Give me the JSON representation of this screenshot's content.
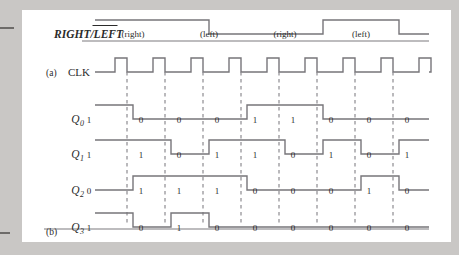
{
  "figure": {
    "part_labels": [
      {
        "name": "a",
        "text": "(a)"
      },
      {
        "name": "b",
        "text": "(b)"
      }
    ]
  },
  "control_signal": {
    "label_left": "RIGHT",
    "label_sep": "/",
    "label_right": "LEFT",
    "label_right_overbar": true,
    "full_label": "RIGHT/LEFT",
    "segments": [
      {
        "text": "(right)",
        "level": 1
      },
      {
        "text": "(left)",
        "level": 0
      },
      {
        "text": "(right)",
        "level": 1
      },
      {
        "text": "(left)",
        "level": 0
      }
    ]
  },
  "clock": {
    "label": "CLK",
    "pulse_count": 9
  },
  "chart_data": {
    "type": "timing-diagram",
    "clock_periods": 10,
    "signals": [
      {
        "name": "RIGHT/LEFT",
        "kind": "control",
        "values": [
          1,
          1,
          1,
          0,
          0,
          0,
          1,
          1,
          0,
          0
        ],
        "annotations": [
          "(right)",
          "(left)",
          "(right)",
          "(left)"
        ]
      },
      {
        "name": "CLK",
        "kind": "clock",
        "values": [
          0,
          0,
          0,
          0,
          0,
          0,
          0,
          0,
          0,
          0
        ]
      },
      {
        "name": "Q0",
        "label": "Q",
        "subscript": "0",
        "kind": "data",
        "values": [
          1,
          0,
          0,
          0,
          1,
          1,
          0,
          0,
          0,
          1
        ]
      },
      {
        "name": "Q1",
        "label": "Q",
        "subscript": "1",
        "kind": "data",
        "values": [
          1,
          1,
          0,
          1,
          1,
          0,
          1,
          0,
          1,
          0
        ]
      },
      {
        "name": "Q2",
        "label": "Q",
        "subscript": "2",
        "kind": "data",
        "values": [
          0,
          1,
          1,
          1,
          0,
          0,
          0,
          1,
          0,
          0
        ]
      },
      {
        "name": "Q3",
        "label": "Q",
        "subscript": "3",
        "kind": "data",
        "values": [
          1,
          0,
          1,
          0,
          0,
          0,
          0,
          0,
          0,
          0
        ]
      }
    ],
    "xlabel": "",
    "ylabel": "",
    "grid": "dashed-vertical-at-clock-edges",
    "legend": "none"
  },
  "colors": {
    "background": "#c9c7c5",
    "panel": "#ffffff",
    "waveform": "#77757a",
    "dashed": "#8d8b90",
    "text": "#2b2b2b"
  }
}
